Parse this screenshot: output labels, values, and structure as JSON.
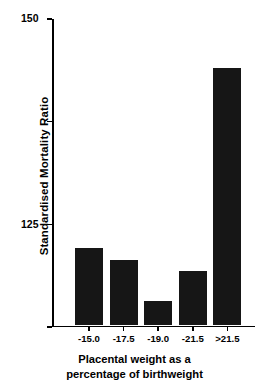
{
  "chart_data": {
    "type": "bar",
    "title": "",
    "subtitle": "",
    "categories": [
      "-15.0",
      "-17.5",
      "-19.0",
      "-21.5",
      ">21.5"
    ],
    "values": [
      93.7,
      90.8,
      80.8,
      88.3,
      137.6
    ],
    "series": [
      {
        "name": "Standardised Mortality Ratio",
        "values": [
          93.7,
          90.8,
          80.8,
          88.3,
          137.6
        ]
      }
    ],
    "xlabel": "Placental weight as a percentage of birthweight",
    "xlabel_lines": [
      "Placental weight as a",
      "percentage of birthweight"
    ],
    "ylabel": "Standardised Mortality Ratio",
    "ylim": [
      75,
      150
    ],
    "yticks": [
      75,
      100,
      125,
      150
    ],
    "ytick_labels": [
      "75",
      "100",
      "125",
      "150"
    ],
    "xtick_labels": [
      "-15.0",
      "-17.5",
      "-19.0",
      "-21.5",
      ">21.5"
    ],
    "grid": false,
    "legend": false,
    "legend_position": "none",
    "bar_color": "#161616",
    "axis_color": "#000000",
    "background_color": "#ffffff"
  }
}
